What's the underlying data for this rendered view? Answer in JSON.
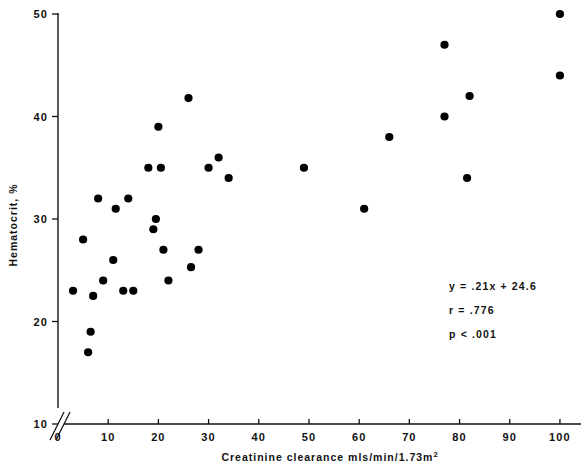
{
  "chart_data": {
    "type": "scatter",
    "title": "",
    "xlabel": "Creatinine clearance mls/min/1.73m2",
    "xlabel_main": "Creatinine clearance mls/min/1.73m",
    "xlabel_sup": "2",
    "ylabel": "Hematocrit, %",
    "xlim": [
      0,
      103
    ],
    "ylim": [
      10,
      50
    ],
    "xticks": [
      "0",
      "10",
      "20",
      "30",
      "40",
      "50",
      "60",
      "70",
      "80",
      "90",
      "100"
    ],
    "xtick_values": [
      0,
      10,
      20,
      30,
      40,
      50,
      60,
      70,
      80,
      90,
      100
    ],
    "yticks": [
      "10",
      "20",
      "30",
      "40",
      "50"
    ],
    "ytick_values": [
      10,
      20,
      30,
      40,
      50
    ],
    "grid": false,
    "legend": "none",
    "axis_break_y": true,
    "marker": "filled-circle",
    "marker_color": "#000000",
    "points": [
      {
        "x": 3,
        "y": 23.0
      },
      {
        "x": 5,
        "y": 28.0
      },
      {
        "x": 6,
        "y": 17.0
      },
      {
        "x": 6.5,
        "y": 19.0
      },
      {
        "x": 7,
        "y": 22.5
      },
      {
        "x": 8,
        "y": 32.0
      },
      {
        "x": 9,
        "y": 24.0
      },
      {
        "x": 11,
        "y": 26.0
      },
      {
        "x": 11.5,
        "y": 31.0
      },
      {
        "x": 13,
        "y": 23.0
      },
      {
        "x": 15,
        "y": 23.0
      },
      {
        "x": 14,
        "y": 32.0
      },
      {
        "x": 18,
        "y": 35.0
      },
      {
        "x": 19,
        "y": 29.0
      },
      {
        "x": 19.5,
        "y": 30.0
      },
      {
        "x": 20,
        "y": 39.0
      },
      {
        "x": 20.5,
        "y": 35.0
      },
      {
        "x": 21,
        "y": 27.0
      },
      {
        "x": 22,
        "y": 24.0
      },
      {
        "x": 26,
        "y": 41.8
      },
      {
        "x": 26.5,
        "y": 25.3
      },
      {
        "x": 28,
        "y": 27.0
      },
      {
        "x": 30,
        "y": 35.0
      },
      {
        "x": 32,
        "y": 36.0
      },
      {
        "x": 34,
        "y": 34.0
      },
      {
        "x": 49,
        "y": 35.0
      },
      {
        "x": 61,
        "y": 31.0
      },
      {
        "x": 66,
        "y": 38.0
      },
      {
        "x": 77,
        "y": 40.0
      },
      {
        "x": 77,
        "y": 47.0
      },
      {
        "x": 81.5,
        "y": 34.0
      },
      {
        "x": 82,
        "y": 42.0
      },
      {
        "x": 100,
        "y": 44.0
      },
      {
        "x": 100,
        "y": 50.0
      }
    ],
    "annotations": {
      "equation": "y = .21x + 24.6",
      "correlation": "r = .776",
      "pvalue": "p < .001"
    }
  }
}
